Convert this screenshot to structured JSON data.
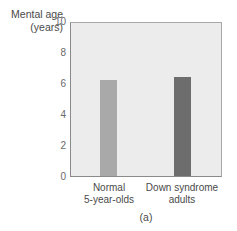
{
  "chart_data": {
    "type": "bar",
    "title": "",
    "caption": "(a)",
    "ylabel_line1": "Mental age",
    "ylabel_line2": "(years)",
    "xlabel": "",
    "ylim": [
      0,
      10
    ],
    "yticks": [
      "10",
      "8",
      "6",
      "4",
      "2",
      "0"
    ],
    "grid": false,
    "legend": null,
    "categories": [
      {
        "line1": "Normal",
        "line2": "5-year-olds"
      },
      {
        "line1": "Down syndrome",
        "line2": "adults"
      }
    ],
    "values": [
      6.3,
      6.5
    ],
    "colors": [
      "#a9a9a9",
      "#6d6d6d"
    ],
    "plot_background": "#ececec"
  }
}
